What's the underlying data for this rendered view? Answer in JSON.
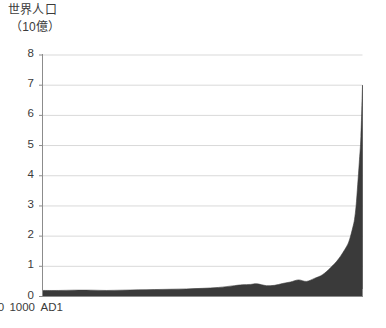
{
  "chart_data": {
    "type": "area",
    "title": "世界人口",
    "subtitle": "（10億）",
    "ylabel": "世界人口（10億）",
    "xlabel": "",
    "grid": true,
    "legend": null,
    "xlim": [
      1,
      2000
    ],
    "ylim": [
      0,
      8
    ],
    "yticks": [
      "0",
      "1",
      "2",
      "3",
      "4",
      "5",
      "6",
      "7",
      "8"
    ],
    "ytick_values": [
      0,
      1,
      2,
      3,
      4,
      5,
      6,
      7,
      8
    ],
    "xticks": [
      "AD1",
      "1000",
      "2000"
    ],
    "xtick_values": [
      1,
      1000,
      2000
    ],
    "series_name": "世界人口",
    "units": "10億人",
    "fill_color": "#3a3a3a",
    "grid_color": "#d9d9d9",
    "axis_color": "#8c8c8c",
    "text_color": "#3b3b3b",
    "x": [
      1,
      100,
      200,
      300,
      400,
      500,
      600,
      700,
      800,
      900,
      1000,
      1100,
      1200,
      1250,
      1300,
      1340,
      1400,
      1450,
      1500,
      1550,
      1600,
      1650,
      1700,
      1750,
      1800,
      1850,
      1900,
      1920,
      1940,
      1950,
      1960,
      1970,
      1980,
      1990,
      2000
    ],
    "values": [
      0.2,
      0.2,
      0.21,
      0.21,
      0.2,
      0.21,
      0.22,
      0.23,
      0.24,
      0.25,
      0.27,
      0.3,
      0.36,
      0.39,
      0.4,
      0.42,
      0.36,
      0.37,
      0.43,
      0.48,
      0.55,
      0.5,
      0.6,
      0.72,
      0.95,
      1.24,
      1.65,
      1.9,
      2.3,
      2.55,
      3.0,
      3.7,
      4.45,
      5.3,
      7.0
    ]
  }
}
